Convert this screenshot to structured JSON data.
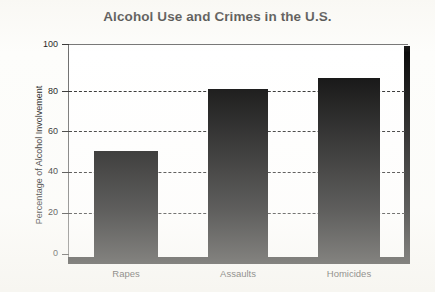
{
  "chart_data": {
    "type": "bar",
    "title": "Alcohol Use and Crimes in the U.S.",
    "xlabel": "",
    "ylabel": "Percentage of Alcohol Involvement",
    "categories": [
      "Rapes",
      "Assaults",
      "Homicides"
    ],
    "values": [
      50,
      79,
      84
    ],
    "ylim": [
      0,
      100
    ],
    "yticks": [
      "0",
      "20",
      "40",
      "60",
      "80",
      "100"
    ],
    "grid": "horizontal-dashed",
    "legend": "none",
    "bar_color": "#0c0c0c",
    "background_color": "#ffffff"
  },
  "axis": {
    "y_title": "Percentage of Alcohol Involvement",
    "ticks": [
      {
        "label": "100",
        "value": 100
      },
      {
        "label": "80",
        "value": 80
      },
      {
        "label": "60",
        "value": 60
      },
      {
        "label": "40",
        "value": 40
      },
      {
        "label": "20",
        "value": 20
      },
      {
        "label": "0",
        "value": 0
      }
    ]
  },
  "bars": [
    {
      "label": "Rapes",
      "value": 50
    },
    {
      "label": "Assaults",
      "value": 79
    },
    {
      "label": "Homicides",
      "value": 84
    }
  ]
}
